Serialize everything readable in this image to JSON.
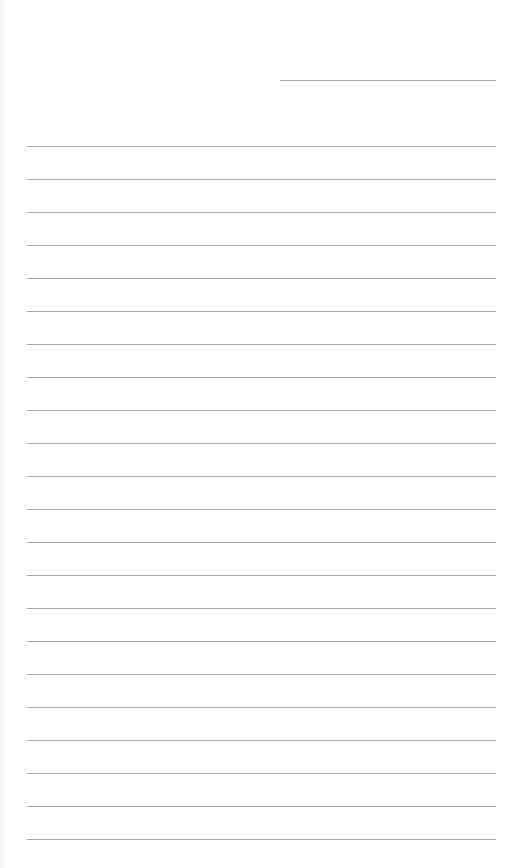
{
  "page": {
    "type": "lined-notepaper",
    "background_color": "#ffffff",
    "line_color": "#a9a9a9",
    "header_line": {
      "x": 280,
      "y": 80,
      "width": 216,
      "label": ""
    },
    "ruled_lines": {
      "count": 22,
      "start_y": 146,
      "spacing": 33,
      "x": 27,
      "width": 469
    },
    "text_content": []
  }
}
